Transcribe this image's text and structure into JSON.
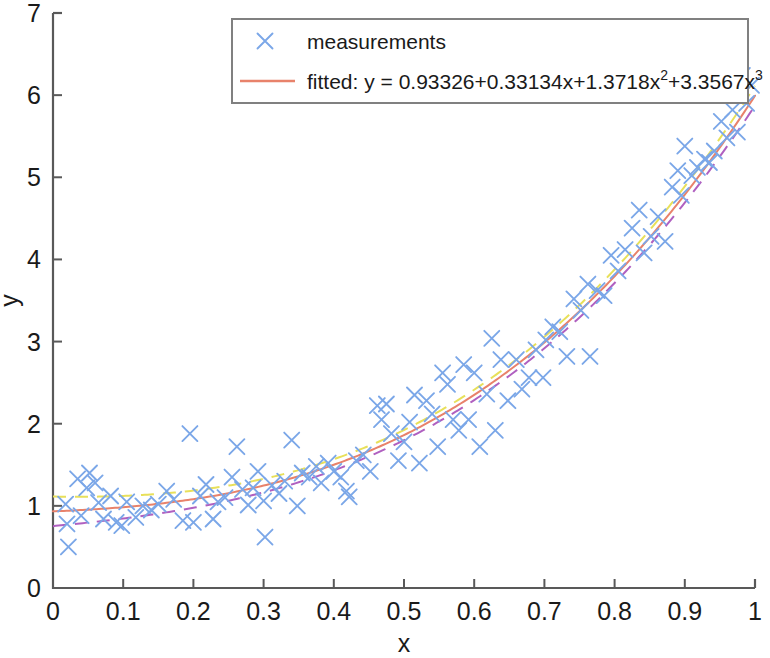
{
  "figure": {
    "background": "#ffffff",
    "plot_box": {
      "left": 53,
      "top": 13,
      "right": 755,
      "bottom": 588
    },
    "axis_color": "#595959"
  },
  "axes": {
    "x_title": "x",
    "y_title": "y",
    "x_ticks": [
      "0",
      "0.1",
      "0.2",
      "0.3",
      "0.4",
      "0.5",
      "0.6",
      "0.7",
      "0.8",
      "0.9",
      "1"
    ],
    "y_ticks": [
      "0",
      "1",
      "2",
      "3",
      "4",
      "5",
      "6",
      "7"
    ],
    "x_tick_values": [
      0,
      0.1,
      0.2,
      0.3,
      0.4,
      0.5,
      0.6,
      0.7,
      0.8,
      0.9,
      1
    ],
    "y_tick_values": [
      0,
      1,
      2,
      3,
      4,
      5,
      6,
      7
    ]
  },
  "legend": {
    "box": {
      "left": 232,
      "top": 19,
      "right": 748,
      "bottom": 103
    },
    "entries": [
      {
        "label": "measurements",
        "marker": "x-marker",
        "color": "#7ba7e8",
        "style": "marker"
      },
      {
        "label_prefix": "fitted: y = 0.93326+0.33134x+1.3718x",
        "sup1": "2",
        "label_mid": "+3.3567x",
        "sup2": "3",
        "color": "#e8826b",
        "style": "line"
      }
    ]
  },
  "chart_data": {
    "type": "scatter",
    "title": "",
    "xlabel": "x",
    "ylabel": "y",
    "xlim": [
      0,
      1
    ],
    "ylim": [
      0,
      7
    ],
    "grid": false,
    "legend_position": "top-center",
    "fit_equation": "y = 0.93326+0.33134x+1.3718x^2+3.3567x^3",
    "fit_coefficients": {
      "c0": 0.93326,
      "c1": 0.33134,
      "c2": 1.3718,
      "c3": 3.3567
    },
    "series": [
      {
        "name": "measurements",
        "type": "scatter",
        "marker": "x",
        "color": "#7ba7e8",
        "points": [
          [
            0.018,
            1.02
          ],
          [
            0.02,
            0.78
          ],
          [
            0.022,
            0.5
          ],
          [
            0.035,
            1.33
          ],
          [
            0.04,
            0.88
          ],
          [
            0.048,
            1.22
          ],
          [
            0.052,
            1.4
          ],
          [
            0.06,
            1.28
          ],
          [
            0.065,
            1.04
          ],
          [
            0.072,
            0.84
          ],
          [
            0.082,
            1.12
          ],
          [
            0.09,
            0.8
          ],
          [
            0.098,
            0.76
          ],
          [
            0.105,
            1.05
          ],
          [
            0.118,
            0.86
          ],
          [
            0.128,
            1.0
          ],
          [
            0.14,
            0.95
          ],
          [
            0.15,
            1.02
          ],
          [
            0.162,
            1.18
          ],
          [
            0.172,
            1.08
          ],
          [
            0.185,
            0.82
          ],
          [
            0.195,
            1.88
          ],
          [
            0.2,
            0.8
          ],
          [
            0.21,
            1.12
          ],
          [
            0.218,
            1.26
          ],
          [
            0.228,
            0.84
          ],
          [
            0.235,
            1.05
          ],
          [
            0.245,
            1.1
          ],
          [
            0.255,
            1.35
          ],
          [
            0.262,
            1.72
          ],
          [
            0.27,
            1.2
          ],
          [
            0.278,
            1.01
          ],
          [
            0.285,
            1.22
          ],
          [
            0.292,
            1.42
          ],
          [
            0.3,
            1.06
          ],
          [
            0.302,
            0.62
          ],
          [
            0.312,
            1.25
          ],
          [
            0.322,
            1.15
          ],
          [
            0.33,
            1.3
          ],
          [
            0.34,
            1.8
          ],
          [
            0.348,
            1.0
          ],
          [
            0.355,
            1.4
          ],
          [
            0.365,
            1.35
          ],
          [
            0.375,
            1.48
          ],
          [
            0.382,
            1.28
          ],
          [
            0.392,
            1.52
          ],
          [
            0.4,
            1.42
          ],
          [
            0.41,
            1.35
          ],
          [
            0.418,
            1.18
          ],
          [
            0.422,
            1.11
          ],
          [
            0.432,
            1.55
          ],
          [
            0.442,
            1.62
          ],
          [
            0.452,
            1.42
          ],
          [
            0.462,
            2.22
          ],
          [
            0.468,
            2.05
          ],
          [
            0.475,
            2.24
          ],
          [
            0.482,
            1.88
          ],
          [
            0.492,
            1.55
          ],
          [
            0.5,
            1.78
          ],
          [
            0.508,
            2.02
          ],
          [
            0.515,
            2.35
          ],
          [
            0.522,
            1.52
          ],
          [
            0.532,
            2.28
          ],
          [
            0.54,
            2.12
          ],
          [
            0.548,
            1.72
          ],
          [
            0.555,
            2.62
          ],
          [
            0.562,
            2.48
          ],
          [
            0.57,
            2.05
          ],
          [
            0.578,
            1.92
          ],
          [
            0.585,
            2.72
          ],
          [
            0.592,
            2.05
          ],
          [
            0.6,
            2.62
          ],
          [
            0.608,
            1.72
          ],
          [
            0.618,
            2.36
          ],
          [
            0.625,
            3.04
          ],
          [
            0.63,
            1.92
          ],
          [
            0.638,
            2.78
          ],
          [
            0.648,
            2.28
          ],
          [
            0.66,
            2.78
          ],
          [
            0.668,
            2.42
          ],
          [
            0.678,
            2.56
          ],
          [
            0.688,
            2.9
          ],
          [
            0.698,
            2.56
          ],
          [
            0.702,
            3.02
          ],
          [
            0.712,
            3.18
          ],
          [
            0.722,
            3.12
          ],
          [
            0.732,
            2.82
          ],
          [
            0.742,
            3.52
          ],
          [
            0.752,
            3.38
          ],
          [
            0.762,
            3.7
          ],
          [
            0.765,
            2.82
          ],
          [
            0.775,
            3.62
          ],
          [
            0.785,
            3.56
          ],
          [
            0.795,
            4.05
          ],
          [
            0.805,
            3.86
          ],
          [
            0.815,
            4.12
          ],
          [
            0.825,
            4.38
          ],
          [
            0.835,
            4.6
          ],
          [
            0.842,
            4.08
          ],
          [
            0.852,
            4.28
          ],
          [
            0.862,
            4.52
          ],
          [
            0.872,
            4.22
          ],
          [
            0.882,
            4.88
          ],
          [
            0.89,
            5.08
          ],
          [
            0.895,
            4.78
          ],
          [
            0.9,
            5.38
          ],
          [
            0.91,
            5.02
          ],
          [
            0.918,
            5.12
          ],
          [
            0.928,
            5.22
          ],
          [
            0.935,
            5.18
          ],
          [
            0.942,
            5.32
          ],
          [
            0.952,
            5.68
          ],
          [
            0.96,
            5.48
          ],
          [
            0.968,
            5.82
          ],
          [
            0.975,
            5.55
          ],
          [
            0.982,
            6.24
          ],
          [
            0.988,
            5.9
          ],
          [
            0.995,
            6.12
          ]
        ]
      },
      {
        "name": "fitted",
        "type": "line",
        "style": "solid",
        "color": "#e8826b",
        "width": 2,
        "coefficients": [
          0.93326,
          0.33134,
          1.3718,
          3.3567
        ]
      },
      {
        "name": "upper-bound",
        "type": "line",
        "style": "dashed",
        "color": "#e8e05a",
        "width": 2,
        "offset_start": 0.18,
        "offset_end": 0.12
      },
      {
        "name": "lower-bound",
        "type": "line",
        "style": "dashed",
        "color": "#b060c0",
        "width": 2,
        "offset_start": -0.18,
        "offset_end": -0.12
      }
    ]
  }
}
